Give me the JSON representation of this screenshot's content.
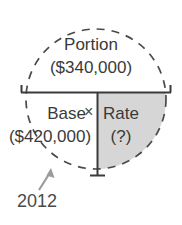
{
  "diagram": {
    "type": "percent-circle-formula",
    "title_region": {
      "label": "Portion",
      "value": "($340,000)"
    },
    "left_region": {
      "label": "Base",
      "value": "($420,000)"
    },
    "operator": "×",
    "right_region": {
      "label": "Rate",
      "value": "(?)"
    },
    "annotation": {
      "label": "2012",
      "target": "dashed-circle"
    },
    "colors": {
      "shaded_quadrant": "#d6d6d6",
      "line": "#3a3a3a",
      "dashed_circle": "#4a4a4a",
      "arrow": "#9b9b9b",
      "text": "#3a3a3a",
      "background": "#ffffff"
    },
    "geometry": {
      "circle_center_x": 96,
      "circle_center_y": 99,
      "circle_radius": 70,
      "horizontal_divider_y": 92,
      "horizontal_divider_x1": 21,
      "horizontal_divider_x2": 171,
      "vertical_divider_x": 97,
      "vertical_divider_y1": 92,
      "vertical_divider_y2": 176
    }
  }
}
